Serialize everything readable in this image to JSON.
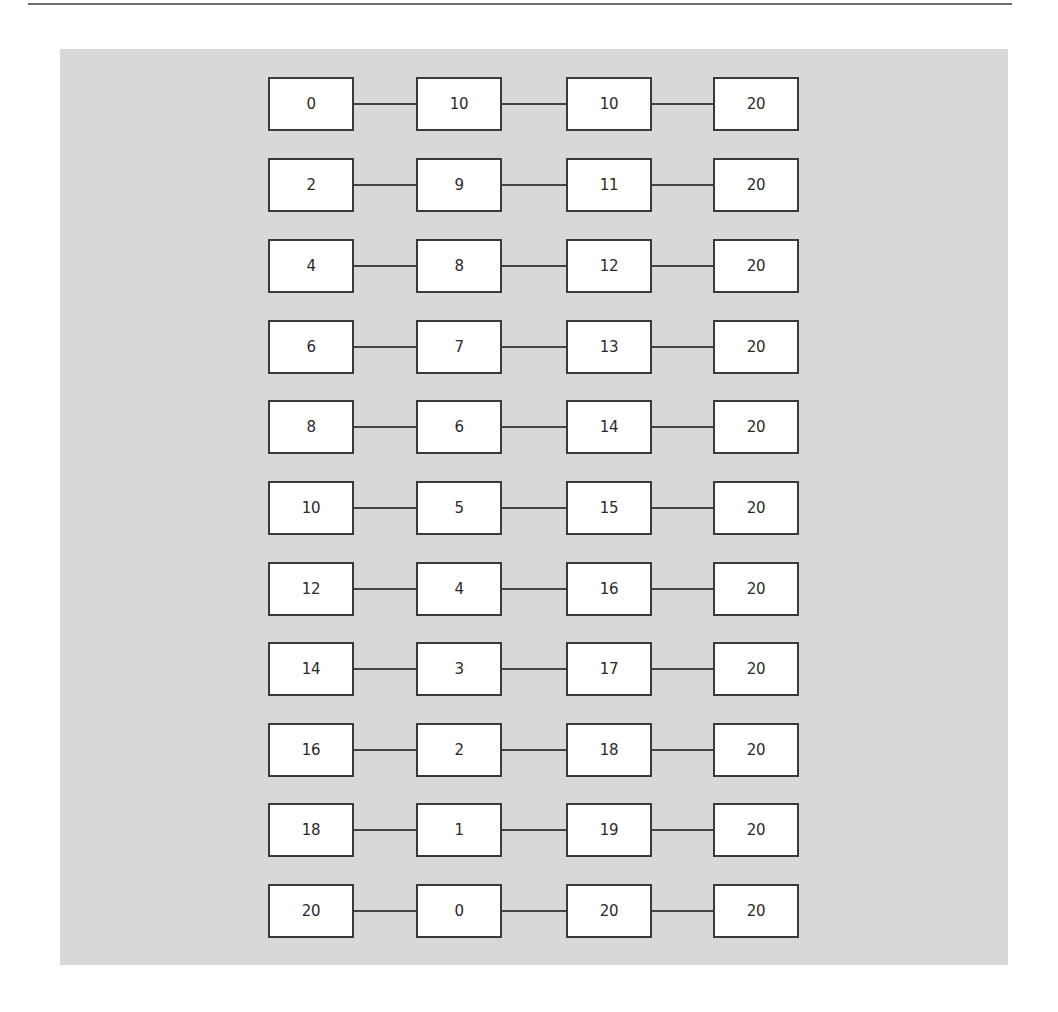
{
  "diagram": {
    "columns": 4,
    "rows": [
      {
        "values": [
          "0",
          "10",
          "10",
          "20"
        ]
      },
      {
        "values": [
          "2",
          "9",
          "11",
          "20"
        ]
      },
      {
        "values": [
          "4",
          "8",
          "12",
          "20"
        ]
      },
      {
        "values": [
          "6",
          "7",
          "13",
          "20"
        ]
      },
      {
        "values": [
          "8",
          "6",
          "14",
          "20"
        ]
      },
      {
        "values": [
          "10",
          "5",
          "15",
          "20"
        ]
      },
      {
        "values": [
          "12",
          "4",
          "16",
          "20"
        ]
      },
      {
        "values": [
          "14",
          "3",
          "17",
          "20"
        ]
      },
      {
        "values": [
          "16",
          "2",
          "18",
          "20"
        ]
      },
      {
        "values": [
          "18",
          "1",
          "19",
          "20"
        ]
      },
      {
        "values": [
          "20",
          "0",
          "20",
          "20"
        ]
      }
    ]
  },
  "colors": {
    "panel_background": "#d8d8d8",
    "box_fill": "#ffffff",
    "box_border": "#3a3a3a",
    "connector": "#444444",
    "top_rule": "#6e6e6e"
  }
}
